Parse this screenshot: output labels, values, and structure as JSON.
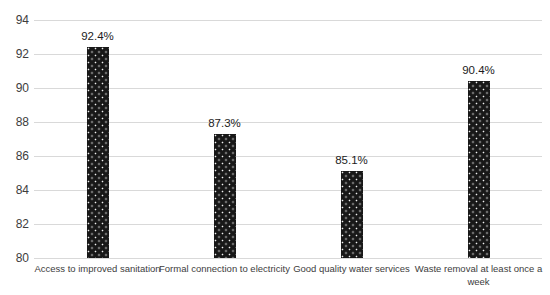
{
  "chart_data": {
    "type": "bar",
    "title": "",
    "xlabel": "",
    "ylabel": "",
    "categories": [
      "Access to improved sanitation",
      "Formal connection to electricity",
      "Good quality water services",
      "Waste removal at least once a week"
    ],
    "values": [
      92.4,
      87.3,
      85.1,
      90.4
    ],
    "data_labels": [
      "92.4%",
      "87.3%",
      "85.1%",
      "90.4%"
    ],
    "ylim": [
      80,
      94
    ],
    "yticks": [
      94,
      92,
      90,
      88,
      86,
      84,
      82,
      80
    ],
    "grid": true,
    "legend": false,
    "bar_pattern": "black-with-white-dots",
    "colors": {
      "bar_fill": "#181818",
      "bar_dot": "#f2f2f2",
      "gridline": "#d9d9d9",
      "axis_text": "#3d3d3d",
      "value_label_text": "#1c1c1c",
      "background": "#ffffff"
    }
  }
}
